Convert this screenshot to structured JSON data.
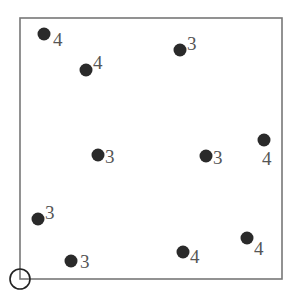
{
  "diagram": {
    "frame": {
      "x": 20,
      "y": 18,
      "width": 262,
      "height": 261,
      "stroke": "#777777"
    },
    "origin_marker": {
      "cx": 20,
      "cy": 279,
      "r": 10,
      "stroke": "#222222"
    },
    "point_color": "#2a2a2a",
    "label_color": "#555555",
    "points": [
      {
        "cx": 44,
        "cy": 34,
        "label": "4",
        "lx": 53,
        "ly": 46
      },
      {
        "cx": 86,
        "cy": 70,
        "label": "4",
        "lx": 93,
        "ly": 69
      },
      {
        "cx": 180,
        "cy": 50,
        "label": "3",
        "lx": 187,
        "ly": 50
      },
      {
        "cx": 98,
        "cy": 155,
        "label": "3",
        "lx": 105,
        "ly": 163
      },
      {
        "cx": 206,
        "cy": 156,
        "label": "3",
        "lx": 213,
        "ly": 164
      },
      {
        "cx": 264,
        "cy": 140,
        "label": "4",
        "lx": 262,
        "ly": 165
      },
      {
        "cx": 38,
        "cy": 219,
        "label": "3",
        "lx": 45,
        "ly": 219
      },
      {
        "cx": 71,
        "cy": 261,
        "label": "3",
        "lx": 80,
        "ly": 268
      },
      {
        "cx": 183,
        "cy": 252,
        "label": "4",
        "lx": 190,
        "ly": 263
      },
      {
        "cx": 247,
        "cy": 238,
        "label": "4",
        "lx": 254,
        "ly": 255
      }
    ]
  }
}
